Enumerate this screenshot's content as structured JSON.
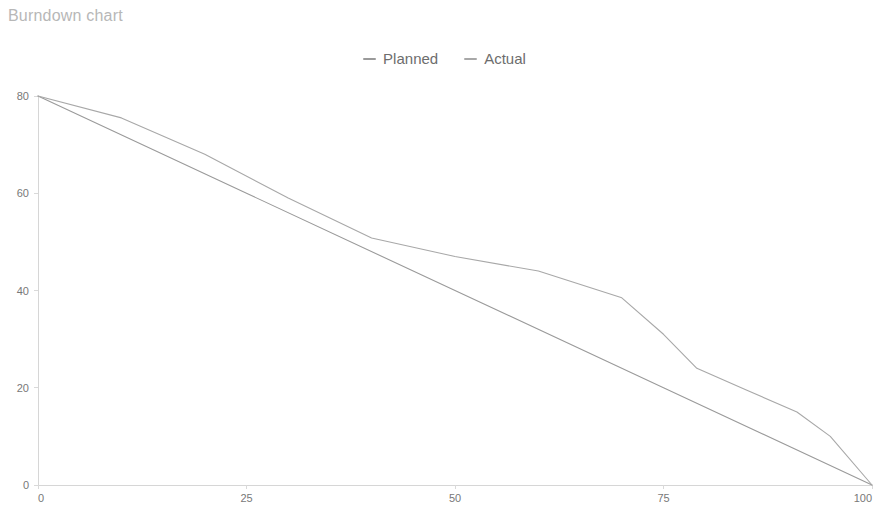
{
  "chart_title": "Burndown chart",
  "legend": {
    "position": "top-center",
    "items": [
      {
        "label": "Planned",
        "color": "#9a9a9a",
        "marker": "dash-marker-icon"
      },
      {
        "label": "Actual",
        "color": "#a8a8a8",
        "marker": "dash-marker-icon"
      }
    ]
  },
  "axes": {
    "x_ticks": [
      "0",
      "25",
      "50",
      "75",
      "100"
    ],
    "y_ticks": [
      "0",
      "20",
      "40",
      "60",
      "80"
    ],
    "axis_color": "#d6d6d6",
    "tick_label_color": "#787878"
  },
  "chart_data": {
    "type": "line",
    "title": "Burndown chart",
    "xlabel": "",
    "ylabel": "",
    "xlim": [
      0,
      100
    ],
    "ylim": [
      0,
      80
    ],
    "xticks": [
      0,
      25,
      50,
      75,
      100
    ],
    "yticks": [
      0,
      20,
      40,
      60,
      80
    ],
    "grid": false,
    "legend_position": "top-center",
    "series": [
      {
        "name": "Planned",
        "color": "#9a9a9a",
        "x": [
          0,
          25,
          50,
          75,
          100
        ],
        "y": [
          80,
          60,
          40,
          20,
          0
        ]
      },
      {
        "name": "Actual",
        "color": "#a8a8a8",
        "x": [
          0,
          10,
          20,
          30,
          40,
          50,
          60,
          70,
          75,
          79,
          85,
          91,
          95,
          100
        ],
        "y": [
          80,
          75.5,
          68,
          59,
          50.8,
          47,
          44,
          38.5,
          31,
          24,
          19.5,
          15,
          10,
          0
        ]
      }
    ]
  }
}
